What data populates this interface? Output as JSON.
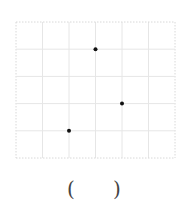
{
  "grid": {
    "origin_x": 16,
    "origin_y": 22,
    "cell_w": 26.5,
    "cell_h": 27.2,
    "cols": 6,
    "rows": 5,
    "line_color": "#e6e6e6",
    "border_color": "#d8d8d8"
  },
  "points": [
    {
      "col": 3,
      "row": 1
    },
    {
      "col": 4,
      "row": 3
    },
    {
      "col": 2,
      "row": 4
    }
  ],
  "point_color": "#111111",
  "answer": {
    "open": "(",
    "close": ")"
  }
}
